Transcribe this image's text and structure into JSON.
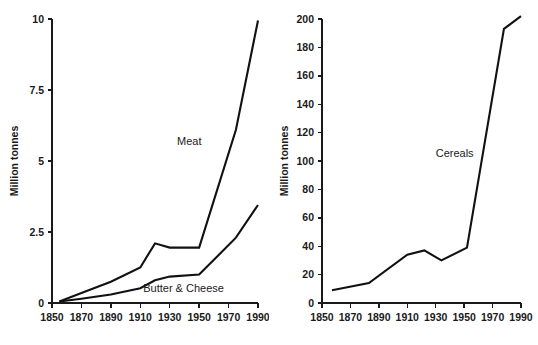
{
  "figure": {
    "background_color": "#ffffff",
    "line_color": "#111111",
    "text_color": "#1a1a1a"
  },
  "chart_data": [
    {
      "type": "line",
      "panel": "left",
      "title": "",
      "xlabel": "",
      "ylabel": "Million tonnes",
      "xlim": [
        1850,
        1990
      ],
      "ylim": [
        0,
        10
      ],
      "xticks": [
        1850,
        1870,
        1890,
        1910,
        1930,
        1950,
        1970,
        1990
      ],
      "xticklabels": [
        "1850",
        "1870",
        "1890",
        "1910",
        "1930",
        "1950",
        "1970",
        "1990"
      ],
      "yticks": [
        0,
        2.5,
        5,
        7.5,
        10
      ],
      "yticklabels": [
        "0",
        "2.5",
        "5",
        "7.5",
        "10"
      ],
      "grid": false,
      "legend": "inline-annotations",
      "series": [
        {
          "name": "Meat",
          "label_position": {
            "x": 1935,
            "y": 5.55
          },
          "x": [
            1855,
            1870,
            1890,
            1910,
            1920,
            1930,
            1950,
            1975,
            1990
          ],
          "values": [
            0.05,
            0.35,
            0.75,
            1.25,
            2.1,
            1.95,
            1.95,
            6.1,
            9.95
          ]
        },
        {
          "name": "Butter & Cheese",
          "label_position": {
            "x": 1912,
            "y": 0.38
          },
          "x": [
            1855,
            1870,
            1890,
            1910,
            1920,
            1930,
            1950,
            1975,
            1990
          ],
          "values": [
            0.05,
            0.15,
            0.3,
            0.52,
            0.8,
            0.93,
            1.0,
            2.3,
            3.45
          ]
        }
      ]
    },
    {
      "type": "line",
      "panel": "right",
      "title": "",
      "xlabel": "",
      "ylabel": "Million tonnes",
      "xlim": [
        1850,
        1990
      ],
      "ylim": [
        0,
        200
      ],
      "xticks": [
        1850,
        1870,
        1890,
        1910,
        1930,
        1950,
        1970,
        1990
      ],
      "xticklabels": [
        "1850",
        "1870",
        "1890",
        "1910",
        "1930",
        "1950",
        "1970",
        "1990"
      ],
      "yticks": [
        0,
        20,
        40,
        60,
        80,
        100,
        120,
        140,
        160,
        180,
        200
      ],
      "yticklabels": [
        "0",
        "20",
        "40",
        "60",
        "80",
        "100",
        "120",
        "140",
        "160",
        "180",
        "200"
      ],
      "grid": false,
      "legend": "inline-annotations",
      "series": [
        {
          "name": "Cereals",
          "label_position": {
            "x": 1930,
            "y": 103
          },
          "x": [
            1857,
            1883,
            1910,
            1922,
            1934,
            1952,
            1978,
            1990
          ],
          "values": [
            9,
            14,
            34,
            37,
            30,
            39,
            193,
            202
          ]
        }
      ]
    }
  ]
}
